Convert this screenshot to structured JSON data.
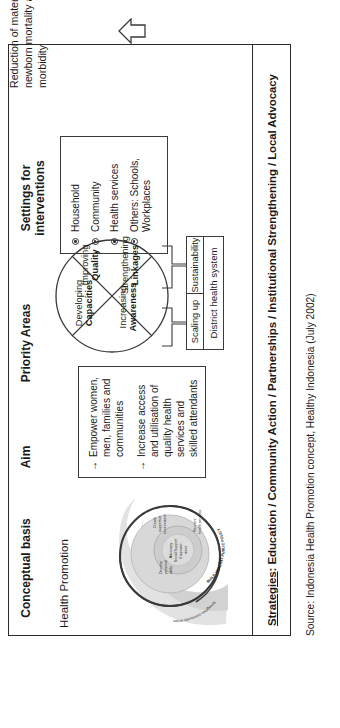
{
  "diagram": {
    "outcome": "Reduction of maternal and newborn mortality and morbidity",
    "columns": {
      "conceptual_basis": "Conceptual basis",
      "aim": "Aim",
      "priority_areas": "Priority Areas",
      "settings": "Settings for interventions"
    },
    "conceptual": {
      "subtitle": "Health Promotion",
      "spiral_labels": {
        "outer_left": "Strengthen community action",
        "upper": "Develop personal skills",
        "right": "Create supportive environment",
        "lower_right": "Reorient health services",
        "policy_ring": "BUILD HEALTHY PUBLIC POLICY",
        "core": "Advocacy Social Support Empowerment",
        "core_lines": [
          "Advocacy",
          "Social Support",
          "Empower-",
          "ment"
        ]
      }
    },
    "aim": {
      "arrow": "→",
      "items": [
        "Empower women, men, families and communities",
        "Increase access and utilisation of quality health services and skilled attendants"
      ]
    },
    "priority": {
      "quadrants": [
        {
          "line1": "Developing",
          "line2": "Capacities"
        },
        {
          "line1": "Improving",
          "line2": "Quality"
        },
        {
          "line1": "Strengthening",
          "line2": "Linkages"
        },
        {
          "line1": "Increasing",
          "line2": "Awareness"
        }
      ],
      "scaling_up": "Scaling up",
      "sustainability": "Sustainability",
      "district_health_system": "District health system"
    },
    "settings": {
      "items": [
        "Household",
        "Community",
        "Health services",
        "Others: Schools, Workplaces"
      ]
    },
    "strategies": {
      "label": "Strategies",
      "colon": ":",
      "text": " Education / Community Action / Partnerships / Institutional Strengthening / Local Advocacy"
    },
    "source": "Source: Indonesia Health Promotion concept, Healthy Indonesia (July 2002)",
    "colors": {
      "stroke": "#2b2b2b",
      "spiral_fill": "#c9c9c9",
      "spiral_fill_light": "#dedede",
      "background": "#ffffff"
    }
  }
}
